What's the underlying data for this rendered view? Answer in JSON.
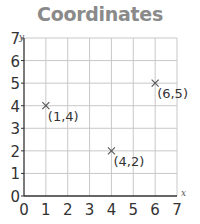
{
  "chart_data": {
    "type": "scatter",
    "title": "Coordinates",
    "xlabel": "x",
    "ylabel": "y",
    "xlim": [
      0,
      7
    ],
    "ylim": [
      0,
      7
    ],
    "grid": true,
    "x_ticks": [
      "0",
      "1",
      "2",
      "3",
      "4",
      "5",
      "6",
      "7"
    ],
    "y_ticks": [
      "0",
      "1",
      "2",
      "3",
      "4",
      "5",
      "6",
      "7"
    ],
    "marker": "x",
    "points": [
      {
        "x": 1,
        "y": 4,
        "label": "(1,4)"
      },
      {
        "x": 4,
        "y": 2,
        "label": "(4,2)"
      },
      {
        "x": 6,
        "y": 5,
        "label": "(6,5)"
      }
    ],
    "colors": {
      "title": "#8a8a8a",
      "grid": "#c8c8c8",
      "axis": "#333333",
      "marker": "#555555",
      "text": "#333333"
    }
  }
}
